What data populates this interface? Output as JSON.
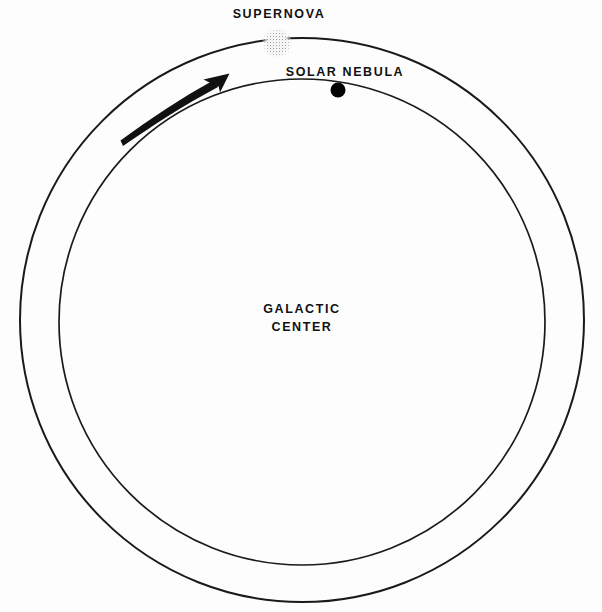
{
  "diagram": {
    "background_color": "#fdfdfd",
    "line_color": "#1a1a1a",
    "labels": {
      "supernova": "SUPERNOVA",
      "solar_nebula": "SOLAR NEBULA",
      "galactic_center_line1": "GALACTIC",
      "galactic_center_line2": "CENTER"
    },
    "orbits": {
      "outer": {
        "cx": 302,
        "cy": 320,
        "r": 282,
        "stroke_width": 2.0
      },
      "inner": {
        "cx": 302,
        "cy": 322,
        "r": 243,
        "stroke_width": 1.7
      }
    },
    "bodies": {
      "supernova": {
        "cx": 277,
        "cy": 43,
        "r": 15,
        "fill": "#b5b5b5",
        "style": "stippled"
      },
      "solar_nebula": {
        "cx": 338,
        "cy": 90,
        "r": 7.5,
        "fill": "#000000",
        "style": "solid"
      }
    },
    "motion_arrow": {
      "direction": "counterclockwise-toward-supernova",
      "tail_x": 120,
      "tail_y": 139,
      "tip_x": 229,
      "tip_y": 74,
      "color": "#111111"
    },
    "label_positions": {
      "supernova": {
        "x": 279,
        "y": 14
      },
      "solar_nebula": {
        "x": 345,
        "y": 72
      },
      "galactic_center": {
        "x": 302,
        "y": 310
      }
    }
  }
}
